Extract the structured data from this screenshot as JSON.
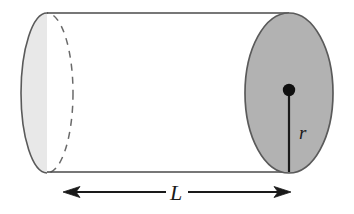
{
  "figure": {
    "name": "cylinder-diagram",
    "background_color": "#ffffff",
    "stroke_color": "#4a4a4a",
    "dark_stroke_color": "#1a1a1a",
    "labels": {
      "radius": "r",
      "length": "L"
    },
    "shapes": {
      "far_cap": {
        "name": "far-circular-face",
        "fill": "#e8e8e8",
        "stroke": "#5a5a5a",
        "cx": 47,
        "cy": 93,
        "rx": 26,
        "ry": 80,
        "hidden_edge_style": "dashed"
      },
      "near_cap": {
        "name": "near-circular-face",
        "fill": "#b2b2b2",
        "stroke": "#5a5a5a",
        "cx": 289,
        "cy": 93,
        "rx": 44,
        "ry": 80
      },
      "body": {
        "name": "cylinder-body",
        "fill": "#ffffff",
        "top_y": 13,
        "bottom_y": 172,
        "left_x": 47,
        "right_x": 289
      },
      "center_dot": {
        "name": "center-point",
        "cx": 289,
        "cy": 90,
        "r": 6,
        "fill": "#101010"
      },
      "radius_line": {
        "name": "radius-segment",
        "x1": 289,
        "y1": 90,
        "x2": 289,
        "y2": 172,
        "stroke": "#1a1a1a"
      },
      "length_arrow": {
        "name": "length-dimension-arrow",
        "x1": 63,
        "x2": 291,
        "y": 192,
        "stroke": "#1a1a1a",
        "double_headed": true
      }
    },
    "label_positions": {
      "radius_label": {
        "x": 299,
        "y": 139,
        "font_size": 19
      },
      "length_label": {
        "x": 176,
        "y": 199,
        "font_size": 21
      }
    }
  }
}
